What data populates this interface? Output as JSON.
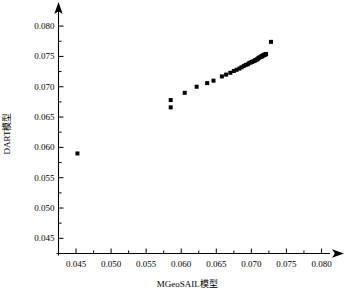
{
  "chart_data": {
    "type": "scatter",
    "title": "",
    "xlabel": "MGeoSAIL模型",
    "ylabel": "DART模型",
    "xlim": [
      0.0425,
      0.0815
    ],
    "ylim": [
      0.0425,
      0.0815
    ],
    "xticks": [
      "0.045",
      "0.050",
      "0.055",
      "0.060",
      "0.065",
      "0.070",
      "0.075",
      "0.080"
    ],
    "xtick_values": [
      0.045,
      0.05,
      0.055,
      0.06,
      0.065,
      0.07,
      0.075,
      0.08
    ],
    "yticks": [
      "0.045",
      "0.050",
      "0.055",
      "0.060",
      "0.065",
      "0.070",
      "0.075",
      "0.080"
    ],
    "ytick_values": [
      0.045,
      0.05,
      0.055,
      0.06,
      0.065,
      0.07,
      0.075,
      0.08
    ],
    "grid": false,
    "legend": null,
    "marker": "square",
    "marker_color": "#000000",
    "marker_size": 4,
    "axis_color": "#000000",
    "background_color": "#ffffff",
    "series": [
      {
        "name": "DART vs MGeoSAIL",
        "x": [
          0.0452,
          0.0585,
          0.0585,
          0.0605,
          0.0622,
          0.0637,
          0.0646,
          0.0658,
          0.0664,
          0.067,
          0.0675,
          0.0679,
          0.0683,
          0.0686,
          0.0689,
          0.0692,
          0.0695,
          0.0697,
          0.0699,
          0.0701,
          0.0703,
          0.0705,
          0.0706,
          0.0708,
          0.0709,
          0.071,
          0.0711,
          0.0713,
          0.0714,
          0.0715,
          0.0716,
          0.0717,
          0.0718,
          0.0719,
          0.072,
          0.0721,
          0.0728
        ],
        "y": [
          0.059,
          0.0678,
          0.0666,
          0.069,
          0.07,
          0.0706,
          0.071,
          0.0717,
          0.072,
          0.0723,
          0.0726,
          0.0728,
          0.073,
          0.0732,
          0.0734,
          0.0736,
          0.0737,
          0.0739,
          0.074,
          0.0741,
          0.0742,
          0.0743,
          0.0744,
          0.0745,
          0.0746,
          0.0747,
          0.0748,
          0.0749,
          0.075,
          0.075,
          0.0751,
          0.0752,
          0.0752,
          0.0753,
          0.0753,
          0.0754,
          0.0774
        ]
      }
    ]
  }
}
